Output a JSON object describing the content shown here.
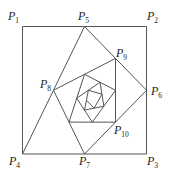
{
  "diagram": {
    "stroke_color": "#555555",
    "label_color": "#222222",
    "square": {
      "corners": [
        "P1",
        "P2",
        "P3",
        "P4"
      ]
    },
    "labels": [
      {
        "name": "P",
        "sub": "1",
        "x": 8,
        "y": 20
      },
      {
        "name": "P",
        "sub": "5",
        "x": 78,
        "y": 20
      },
      {
        "name": "P",
        "sub": "2",
        "x": 147,
        "y": 20
      },
      {
        "name": "P",
        "sub": "9",
        "x": 116,
        "y": 57
      },
      {
        "name": "P",
        "sub": "8",
        "x": 40,
        "y": 88
      },
      {
        "name": "P",
        "sub": "6",
        "x": 151,
        "y": 95
      },
      {
        "name": "P",
        "sub": "10",
        "x": 114,
        "y": 134
      },
      {
        "name": "P",
        "sub": "4",
        "x": 9,
        "y": 165
      },
      {
        "name": "P",
        "sub": "7",
        "x": 79,
        "y": 165
      },
      {
        "name": "P",
        "sub": "3",
        "x": 147,
        "y": 165
      }
    ],
    "points": {
      "P1": [
        22.5,
        26.5
      ],
      "P2": [
        146.5,
        26.5
      ],
      "P3": [
        146.5,
        154
      ],
      "P4": [
        22.5,
        154
      ]
    },
    "spiral_rule": "P(n) = midpoint(P(n-4), P(n-3)), starting from P1..P4 with P5=mid(P1,P2)",
    "spiral_steps": 22
  }
}
